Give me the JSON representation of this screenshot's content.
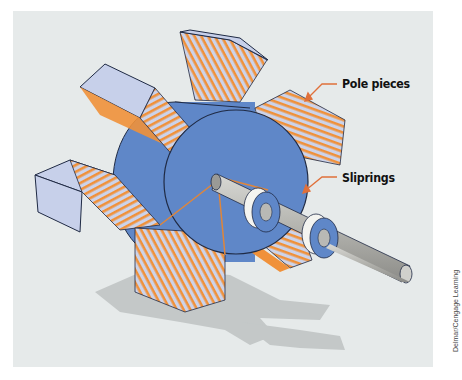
{
  "figure": {
    "labels": {
      "pole_pieces": "Pole pieces",
      "sliprings": "Sliprings"
    },
    "credit": "Delmar/Cengage Learning",
    "colors": {
      "background": "#e6eaea",
      "rotor_blue": "#5f87c8",
      "pole_face": "#c7d0ea",
      "winding_orange": "#f0913a",
      "shaft": "#b9b9b5",
      "ring_white": "#f4f4f0",
      "shadow": "#c6c9c9",
      "arrow": "#e0703a"
    }
  }
}
